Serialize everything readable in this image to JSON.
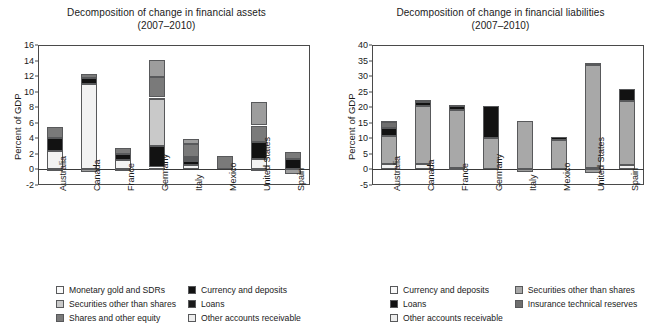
{
  "charts": [
    {
      "id": "assets",
      "title_line1": "Decomposition of change in financial assets",
      "title_line2": "(2007–2010)",
      "ylabel": "Percent of GDP",
      "ylim": [
        -2,
        16
      ],
      "yticks": [
        -2,
        0,
        2,
        4,
        6,
        8,
        10,
        12,
        14,
        16
      ],
      "categories": [
        "Australia",
        "Canada",
        "France",
        "Germany",
        "Italy",
        "Mexico",
        "United States",
        "Spain"
      ],
      "series": [
        {
          "name": "Monetary gold and SDRs",
          "color": "#f2f2f2",
          "values": [
            2.35,
            10.95,
            1.25,
            0.25,
            0.6,
            0.0,
            1.4,
            0.05
          ]
        },
        {
          "name": "Currency and deposits",
          "color": "#121212",
          "values": [
            1.65,
            0.85,
            0.75,
            2.8,
            0.45,
            0.0,
            2.15,
            1.25
          ]
        },
        {
          "name": "Securities other than shares",
          "color": "#c9c9c9",
          "values": [
            0.0,
            0.0,
            0.0,
            6.0,
            0.25,
            0.0,
            0.0,
            0.0
          ]
        },
        {
          "name": "Loans",
          "color": "#ededed",
          "values": [
            0.0,
            0.0,
            0.0,
            0.2,
            0.25,
            0.0,
            0.0,
            0.0
          ]
        },
        {
          "name": "Shares and other equity",
          "color": "#7a7a7a",
          "values": [
            1.4,
            0.45,
            0.8,
            2.6,
            1.7,
            1.7,
            2.1,
            1.0
          ]
        },
        {
          "name": "Other accounts receivable",
          "color": "#9d9d9d",
          "values": [
            0.0,
            0.0,
            0.0,
            2.25,
            0.65,
            0.0,
            3.05,
            0.0
          ]
        }
      ],
      "negative_base": [
        -0.25,
        -0.3,
        -0.1,
        0.0,
        0.0,
        0.0,
        -0.15,
        -0.65
      ],
      "totals": [
        5.4,
        12.2,
        2.8,
        14.1,
        3.9,
        1.7,
        8.7,
        2.3
      ],
      "legend": [
        {
          "label": "Monetary gold and SDRs",
          "color": "#f9f9f9"
        },
        {
          "label": "Currency and deposits",
          "color": "#121212"
        },
        {
          "label": "Securities other than shares",
          "color": "#c9c9c9"
        },
        {
          "label": "Loans",
          "color": "#1a1a1a"
        },
        {
          "label": "Shares and other equity",
          "color": "#7a7a7a"
        },
        {
          "label": "Other accounts receivable",
          "color": "#ededed"
        }
      ]
    },
    {
      "id": "liabilities",
      "title_line1": "Decomposition of change in financial liabilities",
      "title_line2": "(2007–2010)",
      "ylabel": "Percent of GDP",
      "ylim": [
        -5,
        40
      ],
      "yticks": [
        -5,
        0,
        5,
        10,
        15,
        20,
        25,
        30,
        35,
        40
      ],
      "categories": [
        "Australia",
        "Canada",
        "France",
        "Germany",
        "Italy",
        "Mexico",
        "United States",
        "Spain"
      ],
      "series": [
        {
          "name": "Currency and deposits",
          "color": "#f2f2f2",
          "values": [
            1.9,
            1.7,
            0.35,
            0.0,
            0.3,
            0.0,
            0.45,
            1.5
          ]
        },
        {
          "name": "Securities other than shares",
          "color": "#a8a8a8",
          "values": [
            9.0,
            18.7,
            18.8,
            10.2,
            15.3,
            9.6,
            33.1,
            20.6
          ]
        },
        {
          "name": "Loans",
          "color": "#121212",
          "values": [
            2.4,
            1.2,
            1.3,
            10.3,
            0.0,
            0.9,
            0.55,
            3.9
          ]
        },
        {
          "name": "Insurance technical reserves",
          "color": "#6e6e6e",
          "values": [
            1.9,
            0.3,
            0.3,
            0.0,
            0.0,
            0.0,
            0.25,
            0.0
          ]
        },
        {
          "name": "Other accounts receivable",
          "color": "#ededed",
          "values": [
            0.3,
            0.4,
            0.0,
            0.0,
            0.0,
            0.0,
            0.0,
            0.0
          ]
        }
      ],
      "negative_base": [
        0.0,
        0.0,
        0.0,
        0.0,
        -0.8,
        0.0,
        -1.1,
        0.0
      ],
      "totals": [
        15.5,
        22.3,
        20.75,
        20.5,
        15.6,
        10.5,
        34.35,
        26.0
      ],
      "legend": [
        {
          "label": "Currency and deposits",
          "color": "#f9f9f9"
        },
        {
          "label": "Securities other than shares",
          "color": "#a8a8a8"
        },
        {
          "label": "Loans",
          "color": "#121212"
        },
        {
          "label": "Insurance technical reserves",
          "color": "#6e6e6e"
        },
        {
          "label": "Other accounts receivable",
          "color": "#ededed"
        }
      ]
    }
  ],
  "chart_data": {
    "type": "bar",
    "layout": "two stacked bar charts side by side",
    "grid": false,
    "legend_position": "below plot, two columns",
    "panels": [
      {
        "title": "Decomposition of change in financial assets (2007–2010)",
        "xlabel": "",
        "ylabel": "Percent of GDP",
        "ylim": [
          -2,
          16
        ],
        "yticks": [
          -2,
          0,
          2,
          4,
          6,
          8,
          10,
          12,
          14,
          16
        ],
        "categories": [
          "Australia",
          "Canada",
          "France",
          "Germany",
          "Italy",
          "Mexico",
          "United States",
          "Spain"
        ],
        "series": [
          {
            "name": "Monetary gold and SDRs",
            "values": [
              2.35,
              10.95,
              1.25,
              0.25,
              0.6,
              0.0,
              1.4,
              0.05
            ]
          },
          {
            "name": "Currency and deposits",
            "values": [
              1.65,
              0.85,
              0.75,
              2.8,
              0.45,
              0.0,
              2.15,
              1.25
            ]
          },
          {
            "name": "Securities other than shares",
            "values": [
              0.0,
              0.0,
              0.0,
              6.0,
              0.25,
              0.0,
              0.0,
              0.0
            ]
          },
          {
            "name": "Loans",
            "values": [
              0.0,
              0.0,
              0.0,
              0.2,
              0.25,
              0.0,
              0.0,
              0.0
            ]
          },
          {
            "name": "Shares and other equity",
            "values": [
              1.4,
              0.45,
              0.8,
              2.6,
              1.7,
              1.7,
              2.1,
              1.0
            ]
          },
          {
            "name": "Other accounts receivable",
            "values": [
              0.0,
              0.0,
              0.0,
              2.25,
              0.65,
              0.0,
              3.05,
              0.0
            ]
          }
        ],
        "stacked_totals": [
          5.4,
          12.2,
          2.8,
          14.1,
          3.9,
          1.7,
          8.7,
          2.3
        ],
        "negative_segments": [
          -0.25,
          -0.3,
          -0.1,
          0.0,
          0.0,
          0.0,
          -0.15,
          -0.65
        ]
      },
      {
        "title": "Decomposition of change in financial liabilities (2007–2010)",
        "xlabel": "",
        "ylabel": "Percent of GDP",
        "ylim": [
          -5,
          40
        ],
        "yticks": [
          -5,
          0,
          5,
          10,
          15,
          20,
          25,
          30,
          35,
          40
        ],
        "categories": [
          "Australia",
          "Canada",
          "France",
          "Germany",
          "Italy",
          "Mexico",
          "United States",
          "Spain"
        ],
        "series": [
          {
            "name": "Currency and deposits",
            "values": [
              1.9,
              1.7,
              0.35,
              0.0,
              0.3,
              0.0,
              0.45,
              1.5
            ]
          },
          {
            "name": "Securities other than shares",
            "values": [
              9.0,
              18.7,
              18.8,
              10.2,
              15.3,
              9.6,
              33.1,
              20.6
            ]
          },
          {
            "name": "Loans",
            "values": [
              2.4,
              1.2,
              1.3,
              10.3,
              0.0,
              0.9,
              0.55,
              3.9
            ]
          },
          {
            "name": "Insurance technical reserves",
            "values": [
              1.9,
              0.3,
              0.3,
              0.0,
              0.0,
              0.0,
              0.25,
              0.0
            ]
          },
          {
            "name": "Other accounts receivable",
            "values": [
              0.3,
              0.4,
              0.0,
              0.0,
              0.0,
              0.0,
              0.0,
              0.0
            ]
          }
        ],
        "stacked_totals": [
          15.5,
          22.3,
          20.75,
          20.5,
          15.6,
          10.5,
          34.35,
          26.0
        ],
        "negative_segments": [
          0.0,
          0.0,
          0.0,
          0.0,
          -0.8,
          0.0,
          -1.1,
          0.0
        ]
      }
    ]
  }
}
